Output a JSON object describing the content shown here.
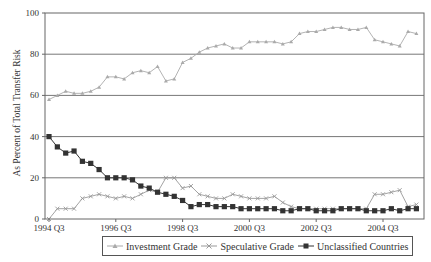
{
  "chart_data": {
    "type": "line",
    "title": "",
    "xlabel": "",
    "ylabel": "As Percent of Total Transfer Risk",
    "ylim": [
      0,
      100
    ],
    "yticks": [
      0,
      20,
      40,
      60,
      80,
      100
    ],
    "grid": "horizontal",
    "legend_position": "bottom",
    "x_tick_labels": [
      "1994 Q3",
      "1996 Q3",
      "1998 Q3",
      "2000 Q3",
      "2002 Q3",
      "2004 Q3"
    ],
    "x": [
      "1994 Q3",
      "1994 Q4",
      "1995 Q1",
      "1995 Q2",
      "1995 Q3",
      "1995 Q4",
      "1996 Q1",
      "1996 Q2",
      "1996 Q3",
      "1996 Q4",
      "1997 Q1",
      "1997 Q2",
      "1997 Q3",
      "1997 Q4",
      "1998 Q1",
      "1998 Q2",
      "1998 Q3",
      "1998 Q4",
      "1999 Q1",
      "1999 Q2",
      "1999 Q3",
      "1999 Q4",
      "2000 Q1",
      "2000 Q2",
      "2000 Q3",
      "2000 Q4",
      "2001 Q1",
      "2001 Q2",
      "2001 Q3",
      "2001 Q4",
      "2002 Q1",
      "2002 Q2",
      "2002 Q3",
      "2002 Q4",
      "2003 Q1",
      "2003 Q2",
      "2003 Q3",
      "2003 Q4",
      "2004 Q1",
      "2004 Q2",
      "2004 Q3",
      "2004 Q4",
      "2005 Q1",
      "2005 Q2",
      "2005 Q3"
    ],
    "series": [
      {
        "name": "Investment Grade",
        "marker": "triangle",
        "color": "#aaaaaa",
        "values": [
          58,
          60,
          62,
          61,
          61,
          62,
          64,
          69,
          69,
          68,
          71,
          72,
          71,
          74,
          67,
          68,
          76,
          78,
          81,
          83,
          84,
          85,
          83,
          83,
          86,
          86,
          86,
          86,
          85,
          86,
          90,
          91,
          91,
          92,
          93,
          93,
          92,
          92,
          93,
          87,
          86,
          85,
          84,
          91,
          90
        ]
      },
      {
        "name": "Speculative Grade",
        "marker": "x",
        "color": "#999999",
        "values": [
          0,
          5,
          5,
          5,
          10,
          11,
          12,
          11,
          10,
          11,
          10,
          12,
          14,
          13,
          20,
          20,
          15,
          16,
          12,
          11,
          10,
          10,
          12,
          11,
          10,
          10,
          10,
          11,
          8,
          6,
          5,
          5,
          5,
          5,
          5,
          5,
          5,
          5,
          5,
          12,
          12,
          13,
          14,
          6,
          7
        ]
      },
      {
        "name": "Unclassified Countries",
        "marker": "square",
        "color": "#333333",
        "values": [
          40,
          35,
          32,
          33,
          28,
          27,
          24,
          20,
          20,
          20,
          19,
          16,
          15,
          13,
          12,
          11,
          9,
          6,
          7,
          7,
          6,
          6,
          6,
          5,
          5,
          5,
          5,
          5,
          4,
          4,
          5,
          5,
          4,
          4,
          4,
          5,
          5,
          5,
          4,
          4,
          4,
          5,
          4,
          5,
          5
        ]
      }
    ]
  },
  "legend": {
    "items": [
      "Investment Grade",
      "Speculative Grade",
      "Unclassified Countries"
    ]
  }
}
